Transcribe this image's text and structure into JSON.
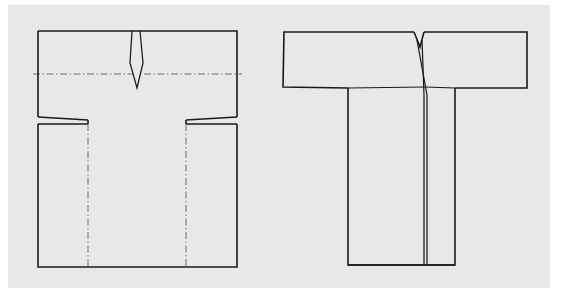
{
  "canvas": {
    "width": 562,
    "height": 300,
    "background_color": "#ffffff",
    "panel_color": "#e8e8e8",
    "line_color": "#1a1a1a",
    "centerline_color": "#6f6f6f"
  },
  "illustration": {
    "title": "Kimono garment flat pattern and finished garment diagram",
    "figure_count": 2,
    "figures": [
      {
        "id": "flat-pattern",
        "name": "Flat pattern layout with fold lines",
        "position": "left",
        "description": "Rectangular pattern piece with horizontal shoulder fold centerline, a narrow neckline dart at center top, stepped underarm notches, and two vertical dash-dot fold lines running down the body panel.",
        "parts": [
          {
            "name": "upper-body-rectangle",
            "line_style": "solid"
          },
          {
            "name": "shoulder-fold-line",
            "line_style": "dash-dot",
            "orientation": "horizontal"
          },
          {
            "name": "neckline-dart",
            "line_style": "solid",
            "shape": "narrow-elongated-wedge"
          },
          {
            "name": "left-underarm-step",
            "line_style": "solid"
          },
          {
            "name": "right-underarm-step",
            "line_style": "solid"
          },
          {
            "name": "lower-body-rectangle",
            "line_style": "solid"
          },
          {
            "name": "left-side-fold-line",
            "line_style": "dash-dot",
            "orientation": "vertical"
          },
          {
            "name": "right-side-fold-line",
            "line_style": "dash-dot",
            "orientation": "vertical"
          }
        ]
      },
      {
        "id": "finished-garment",
        "name": "Finished garment front view",
        "position": "right",
        "description": "T-shaped kimono-style garment with wide horizontal sleeves, a small V-notch at the center neckline, a long center front opening seam, and a straight rectangular body with two vertical seam lines.",
        "parts": [
          {
            "name": "left-sleeve",
            "line_style": "solid"
          },
          {
            "name": "right-sleeve",
            "line_style": "solid"
          },
          {
            "name": "neck-v-notch",
            "line_style": "solid"
          },
          {
            "name": "center-front-opening",
            "line_style": "solid"
          },
          {
            "name": "body-panel",
            "line_style": "solid"
          },
          {
            "name": "left-body-seam",
            "line_style": "solid",
            "orientation": "vertical"
          },
          {
            "name": "right-body-seam",
            "line_style": "solid",
            "orientation": "vertical"
          }
        ]
      }
    ]
  }
}
